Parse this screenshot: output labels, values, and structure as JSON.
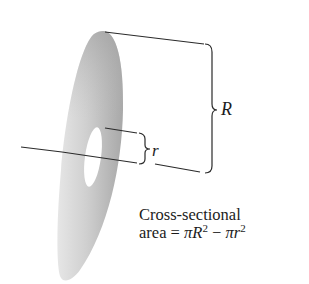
{
  "diagram": {
    "labels": {
      "outer_radius": "R",
      "inner_radius": "r"
    },
    "caption": {
      "line1": "Cross-sectional",
      "line2_prefix": "area = ",
      "pi1": "π",
      "R": "R",
      "exp1": "2",
      "minus": " − ",
      "pi2": "π",
      "r": "r",
      "exp2": "2"
    },
    "colors": {
      "disk_fill_light": "#e2e2e2",
      "disk_fill_dark": "#a9a9a9",
      "line": "#2a2a2a",
      "background": "#ffffff"
    }
  }
}
